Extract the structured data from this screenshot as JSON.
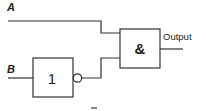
{
  "diagram": {
    "inputs": [
      {
        "label": "A"
      },
      {
        "label": "B"
      }
    ],
    "gates": [
      {
        "type": "NOT",
        "symbol": "1"
      },
      {
        "type": "AND",
        "symbol": "&"
      }
    ],
    "output_label": "Output",
    "footer_mark": "_"
  }
}
